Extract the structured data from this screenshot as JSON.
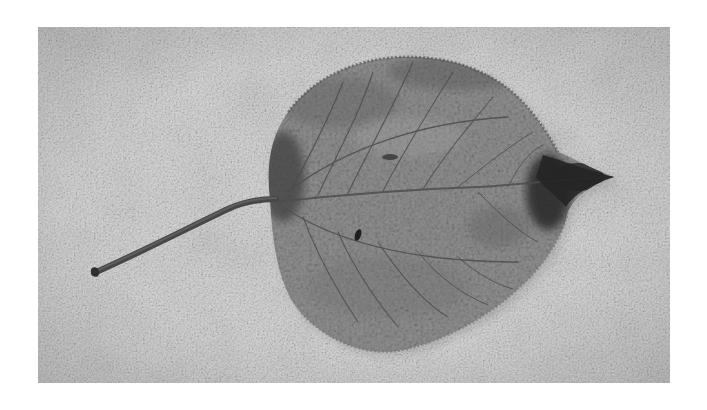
{
  "photo": {
    "subject": "dried leaf on speckled stone surface",
    "style": "grayscale",
    "colors": {
      "page_background": "#ffffff",
      "surface_light": "#d8d8d8",
      "surface_mid": "#b5b5b5",
      "leaf_body": "#8a8a8a",
      "leaf_dark": "#3a3a3a",
      "vein": "#555555",
      "stem": "#4a4a4a"
    },
    "frame": {
      "x": 38,
      "y": 27,
      "width": 632,
      "height": 356
    }
  }
}
